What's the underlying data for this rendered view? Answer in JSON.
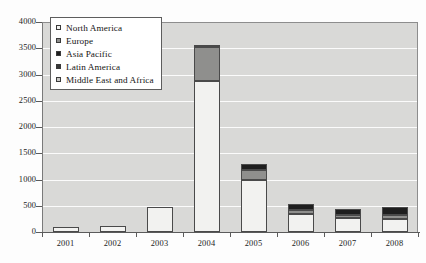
{
  "chart_data": {
    "type": "bar",
    "subtype": "stacked-column",
    "title": "",
    "subtitle": "",
    "xlabel": "",
    "ylabel": "",
    "categories": [
      "2001",
      "2002",
      "2003",
      "2004",
      "2005",
      "2006",
      "2007",
      "2008"
    ],
    "ylim": [
      0,
      4000
    ],
    "ytick_step": 500,
    "yticks": [
      0,
      500,
      1000,
      1500,
      2000,
      2500,
      3000,
      3500,
      4000
    ],
    "ytick_labels": [
      "0",
      "500",
      "1000",
      "1500",
      "2000",
      "2500",
      "3000",
      "3500",
      "4000"
    ],
    "grid": true,
    "grid_axis": "y",
    "legend_position": "top-left-inside",
    "series": [
      {
        "name": "North America",
        "color": "#f2f2f0",
        "values": [
          100,
          110,
          470,
          2870,
          990,
          350,
          260,
          250
        ]
      },
      {
        "name": "Europe",
        "color": "#8f8f8d",
        "values": [
          0,
          0,
          0,
          650,
          200,
          60,
          60,
          70
        ]
      },
      {
        "name": "Asia Pacific",
        "color": "#1e1e1e",
        "values": [
          0,
          0,
          0,
          50,
          100,
          130,
          120,
          150
        ]
      },
      {
        "name": "Latin America",
        "color": "#383838",
        "values": [
          0,
          0,
          0,
          0,
          0,
          0,
          0,
          0
        ]
      },
      {
        "name": "Middle East and Africa",
        "color": "#c9c9c7",
        "values": [
          0,
          0,
          0,
          0,
          0,
          0,
          0,
          0
        ]
      }
    ],
    "totals": [
      100,
      110,
      470,
      3570,
      1290,
      540,
      440,
      470
    ],
    "colors": {
      "plot_background": "#d9d9d7",
      "gridline": "#fbfbfb",
      "axis": "#5b5b5b",
      "bar_outline": "#4a4a4a",
      "legend_border": "#5d5d5d",
      "legend_background": "#ffffff",
      "text": "#1c1c1c"
    }
  },
  "legend": {
    "items": [
      {
        "label": "North America",
        "swatch": "#f2f2f0"
      },
      {
        "label": "Europe",
        "swatch": "#8f8f8d"
      },
      {
        "label": "Asia Pacific",
        "swatch": "#1e1e1e"
      },
      {
        "label": "Latin America",
        "swatch": "#383838"
      },
      {
        "label": "Middle East and Africa",
        "swatch": "#c9c9c7"
      }
    ]
  }
}
